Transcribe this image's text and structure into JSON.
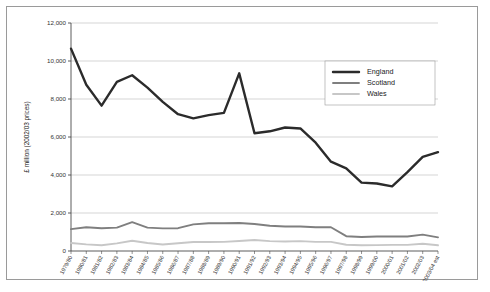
{
  "chart_data": {
    "type": "line",
    "title": "",
    "xlabel": "",
    "ylabel": "£ million (2002/03 prices)",
    "ylim": [
      0,
      12000
    ],
    "ytick_labels": [
      "12,000",
      "10,000",
      "8,000",
      "6,000",
      "4,000",
      "2,000",
      "0"
    ],
    "ytick_values": [
      12000,
      10000,
      8000,
      6000,
      4000,
      2000,
      0
    ],
    "grid": true,
    "legend_position": "upper-right",
    "categories": [
      "1979/80",
      "1980/81",
      "1981/82",
      "1982/83",
      "1983/84",
      "1984/85",
      "1985/86",
      "1986/87",
      "1987/88",
      "1988/89",
      "1989/90",
      "1990/91",
      "1991/92",
      "1992/93",
      "1993/94",
      "1994/95",
      "1995/96",
      "1996/97",
      "1997/98",
      "1998/99",
      "1999/00",
      "2000/01",
      "2001/02",
      "2002/03",
      "2003/04 est"
    ],
    "series": [
      {
        "name": "England",
        "color": "#2b2b2b",
        "width": 2.4,
        "values": [
          10650,
          8750,
          7650,
          8900,
          9250,
          8600,
          7850,
          7200,
          6980,
          7150,
          7270,
          9350,
          6200,
          6300,
          6500,
          6450,
          5700,
          4700,
          4350,
          3600,
          3550,
          3400,
          4150,
          4950,
          5200
        ]
      },
      {
        "name": "Scotland",
        "color": "#7f7f7f",
        "width": 1.9,
        "values": [
          1150,
          1250,
          1200,
          1230,
          1520,
          1230,
          1190,
          1200,
          1400,
          1460,
          1460,
          1470,
          1420,
          1330,
          1290,
          1290,
          1250,
          1250,
          780,
          740,
          760,
          760,
          760,
          860,
          720
        ]
      },
      {
        "name": "Wales",
        "color": "#c7c7c7",
        "width": 1.9,
        "values": [
          420,
          350,
          300,
          400,
          540,
          420,
          340,
          410,
          470,
          470,
          480,
          530,
          580,
          520,
          500,
          520,
          480,
          480,
          330,
          300,
          310,
          320,
          320,
          380,
          300
        ]
      }
    ]
  }
}
